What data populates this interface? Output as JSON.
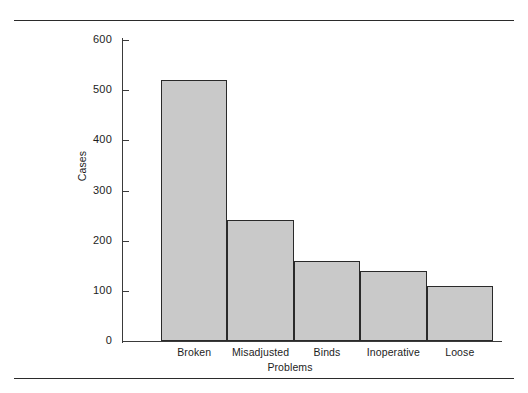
{
  "figure": {
    "top_rule": "horizontal-rule",
    "bottom_rule": "horizontal-rule"
  },
  "chart_data": {
    "type": "bar",
    "title": "",
    "xlabel": "Problems",
    "ylabel": "Cases",
    "categories": [
      "Broken",
      "Misadjusted",
      "Binds",
      "Inoperative",
      "Loose"
    ],
    "values": [
      520,
      242,
      160,
      140,
      110
    ],
    "ylim": [
      0,
      600
    ],
    "yticks": [
      0,
      100,
      200,
      300,
      400,
      500,
      600
    ],
    "ytick_labels": [
      "0",
      "100",
      "200",
      "300",
      "400",
      "500",
      "600"
    ],
    "grid": false,
    "legend": null,
    "bar_fill": "#c9c9c9",
    "bar_edge": "#2a2a2a"
  }
}
